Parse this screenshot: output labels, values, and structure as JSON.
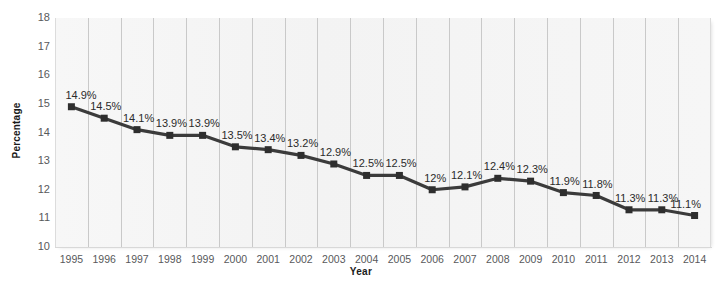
{
  "chart_data": {
    "type": "line",
    "title": "",
    "subtitle": "",
    "xlabel": "Year",
    "ylabel": "Percentage",
    "categories": [
      "1995",
      "1996",
      "1997",
      "1998",
      "1999",
      "2000",
      "2001",
      "2002",
      "2003",
      "2004",
      "2005",
      "2006",
      "2007",
      "2008",
      "2009",
      "2010",
      "2011",
      "2012",
      "2013",
      "2014"
    ],
    "values": [
      14.9,
      14.5,
      14.1,
      13.9,
      13.9,
      13.5,
      13.4,
      13.2,
      12.9,
      12.5,
      12.5,
      12.0,
      12.1,
      12.4,
      12.3,
      11.9,
      11.8,
      11.3,
      11.3,
      11.1
    ],
    "point_labels": [
      "14.9%",
      "14.5%",
      "14.1%",
      "13.9%",
      "13.9%",
      "13.5%",
      "13.4%",
      "13.2%",
      "12.9%",
      "12.5%",
      "12.5%",
      "12%",
      "12.1%",
      "12.4%",
      "12.3%",
      "11.9%",
      "11.8%",
      "11.3%",
      "11.3%",
      "11.1%"
    ],
    "ylim": [
      10,
      18
    ],
    "yticks": [
      "18",
      "17",
      "16",
      "15",
      "14",
      "13",
      "12",
      "11",
      "10"
    ],
    "ytick_values": [
      18,
      17,
      16,
      15,
      14,
      13,
      12,
      11,
      10
    ],
    "grid": "vertical-only",
    "legend": "none",
    "series_color": "#3b3b3b",
    "marker": "square",
    "marker_color": "#2e2e2e",
    "plot_background": "#f4f4f4",
    "gridline_color": "#c9c9c9",
    "tick_label_color": "#58595b"
  },
  "axes": {
    "y_title": "Percentage",
    "x_title": "Year"
  }
}
